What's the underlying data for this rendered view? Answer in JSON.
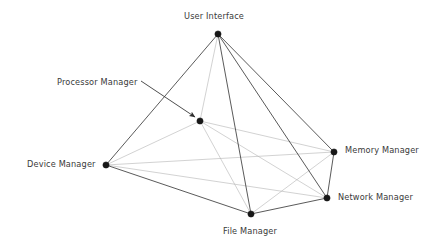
{
  "diagram": {
    "type": "node-link-graph",
    "canvas": {
      "width": 434,
      "height": 241,
      "background": "#ffffff"
    },
    "colors": {
      "node": "#171717",
      "edge_outer": "#3c3c3c",
      "edge_inner": "#b4b4b4",
      "leader": "#3a3a3a",
      "label_text": "#3a3a3a"
    },
    "nodes": [
      {
        "id": "user_interface",
        "label": "User Interface",
        "x": 218,
        "y": 34,
        "r": 3.1,
        "label_x": 184,
        "label_y": 11,
        "label_anchor": "above"
      },
      {
        "id": "processor_manager",
        "label": "Processor Manager",
        "x": 200,
        "y": 121,
        "r": 3.1,
        "label_x": 57,
        "label_y": 77,
        "label_anchor": "leader"
      },
      {
        "id": "device_manager",
        "label": "Device Manager",
        "x": 106,
        "y": 165,
        "r": 3.1,
        "label_x": 27,
        "label_y": 159,
        "label_anchor": "left"
      },
      {
        "id": "memory_manager",
        "label": "Memory Manager",
        "x": 334,
        "y": 152,
        "r": 3.1,
        "label_x": 345,
        "label_y": 145,
        "label_anchor": "right"
      },
      {
        "id": "network_manager",
        "label": "Network Manager",
        "x": 327,
        "y": 198,
        "r": 3.1,
        "label_x": 338,
        "label_y": 192,
        "label_anchor": "right"
      },
      {
        "id": "file_manager",
        "label": "File Manager",
        "x": 251,
        "y": 214,
        "r": 3.1,
        "label_x": 223,
        "label_y": 226,
        "label_anchor": "below"
      }
    ],
    "edges": [
      {
        "from": "user_interface",
        "to": "device_manager",
        "style": "outer"
      },
      {
        "from": "user_interface",
        "to": "memory_manager",
        "style": "outer"
      },
      {
        "from": "user_interface",
        "to": "network_manager",
        "style": "outer"
      },
      {
        "from": "user_interface",
        "to": "file_manager",
        "style": "outer"
      },
      {
        "from": "user_interface",
        "to": "processor_manager",
        "style": "inner"
      },
      {
        "from": "device_manager",
        "to": "file_manager",
        "style": "outer"
      },
      {
        "from": "file_manager",
        "to": "network_manager",
        "style": "outer"
      },
      {
        "from": "network_manager",
        "to": "memory_manager",
        "style": "outer"
      },
      {
        "from": "device_manager",
        "to": "processor_manager",
        "style": "inner"
      },
      {
        "from": "device_manager",
        "to": "memory_manager",
        "style": "inner"
      },
      {
        "from": "device_manager",
        "to": "network_manager",
        "style": "inner"
      },
      {
        "from": "processor_manager",
        "to": "memory_manager",
        "style": "inner"
      },
      {
        "from": "processor_manager",
        "to": "network_manager",
        "style": "inner"
      },
      {
        "from": "processor_manager",
        "to": "file_manager",
        "style": "inner"
      },
      {
        "from": "file_manager",
        "to": "memory_manager",
        "style": "inner"
      }
    ],
    "leader": {
      "from_x": 141,
      "from_y": 81,
      "to_x": 195,
      "to_y": 117,
      "arrowhead": true,
      "label_ref": "processor_manager"
    }
  }
}
